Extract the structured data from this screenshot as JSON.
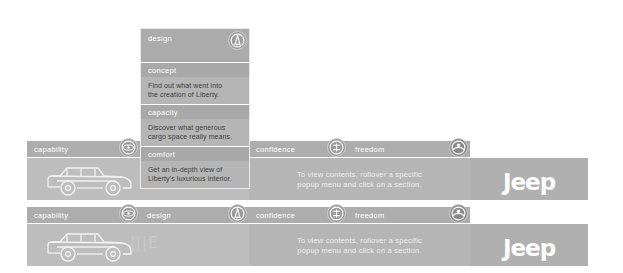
{
  "brand": {
    "logo_text": "Jeep"
  },
  "hint": {
    "text": "To view contents, rollover a specific\npopup menu and click on a section."
  },
  "flyout": {
    "header_label": "design",
    "header_icon": "design-compass-icon",
    "items": [
      {
        "title": "concept",
        "desc": "Find out what went into\nthe creation of Liberty."
      },
      {
        "title": "capacity",
        "desc": "Discover what generous\ncargo space really means."
      },
      {
        "title": "comfort",
        "desc": "Get an in-depth view of\nLiberty's luxurious interior."
      }
    ]
  },
  "row_top": {
    "tabs": [
      {
        "label": "capability",
        "icon": "capability-wheel-icon"
      },
      {
        "label": "confidence",
        "icon": "confidence-shield-icon"
      },
      {
        "label": "freedom",
        "icon": "freedom-sun-icon"
      }
    ]
  },
  "row_bottom": {
    "tabs": [
      {
        "label": "capability",
        "icon": "capability-wheel-icon"
      },
      {
        "label": "design",
        "icon": "design-compass-icon"
      },
      {
        "label": "confidence",
        "icon": "confidence-shield-icon"
      },
      {
        "label": "freedom",
        "icon": "freedom-sun-icon"
      }
    ]
  },
  "artwork": {
    "vehicle_name": "jeep-liberty-outline",
    "decor_glyphs": "|||E"
  },
  "colors": {
    "tab_bar": "#adadad",
    "stage": "#bdbdbd",
    "logo_panel": "#b0b0b0",
    "text_light": "#ffffff",
    "text_dark": "#3d3d3d"
  }
}
